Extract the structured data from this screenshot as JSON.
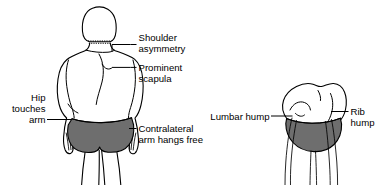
{
  "illustration": {
    "title": "Clinical signs of scoliosis",
    "background_color": "#ffffff",
    "line_color": "#000000",
    "garment_color": "#6e6e6e",
    "skin_fill": "#ffffff"
  },
  "labels": {
    "shoulder_asymmetry": {
      "line1": "Shoulder",
      "line2": "asymmetry"
    },
    "prominent_scapula": {
      "line1": "Prominent",
      "line2": "scapula"
    },
    "hip_touches_arm": {
      "line1": "Hip",
      "line2": "touches",
      "line3": "arm"
    },
    "contralateral_arm": {
      "line1": "Contralateral",
      "line2": "arm hangs free"
    },
    "lumbar_hump": {
      "line1": "Lumbar hump"
    },
    "rib_hump": {
      "line1": "Rib",
      "line2": "hump"
    }
  },
  "figures": {
    "standing": {
      "name": "standing-posterior-view-figure",
      "description": "Posterior view of standing patient with scoliosis"
    },
    "bending": {
      "name": "forward-bending-figure",
      "description": "Forward bending Adams test view showing rib and lumbar humps"
    }
  }
}
